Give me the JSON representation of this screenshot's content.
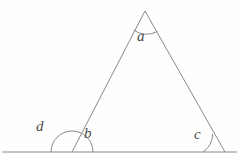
{
  "figure": {
    "background_color": "#fefefe",
    "stroke_color": "#8a8a8a",
    "label_color": "#4a4a4a",
    "stroke_width": 1,
    "geometry": {
      "apex": {
        "x": 145,
        "y": 11
      },
      "base_left": {
        "x": 72,
        "y": 152
      },
      "base_right": {
        "x": 225,
        "y": 152
      },
      "baseline_start": {
        "x": 2,
        "y": 152
      },
      "baseline_end": {
        "x": 237,
        "y": 152
      }
    },
    "arcs": {
      "apex_arc_radius": 22,
      "base_left_arc_radius": 21,
      "base_right_arc_radius": 22
    },
    "labels": {
      "a": "a",
      "b": "b",
      "c": "c",
      "d": "d"
    },
    "label_meanings": {
      "a": "apex interior angle",
      "b": "base-left interior angle",
      "c": "base-right interior angle",
      "d": "base-left exterior angle"
    }
  }
}
